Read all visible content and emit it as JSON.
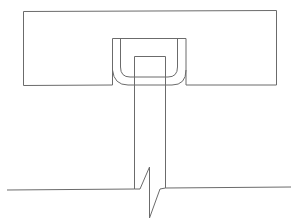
{
  "diagram": {
    "type": "technical-line-drawing",
    "colors": {
      "stroke": "#6b6b6b",
      "background": "#ffffff"
    },
    "components": [
      {
        "id": "top-plate",
        "label": ""
      },
      {
        "id": "notch",
        "label": ""
      },
      {
        "id": "u-clip",
        "label": ""
      },
      {
        "id": "post",
        "label": ""
      },
      {
        "id": "ground-line",
        "label": ""
      },
      {
        "id": "break-symbol",
        "label": ""
      }
    ]
  }
}
